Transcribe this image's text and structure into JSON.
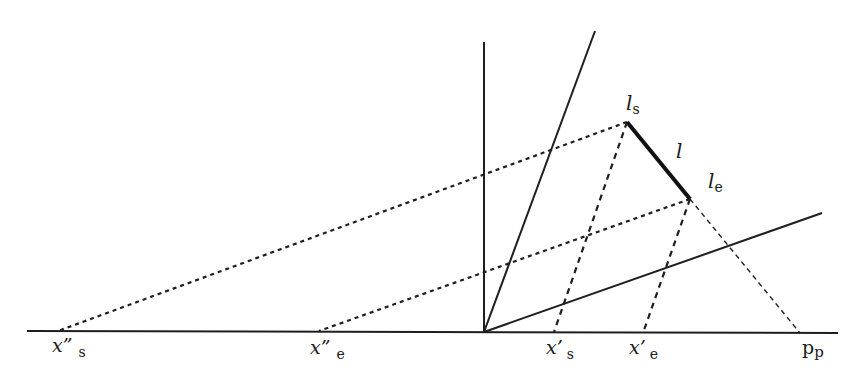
{
  "diagram": {
    "type": "geometric-projection",
    "colors": {
      "line": "#1e1e1e",
      "background": "#ffffff"
    },
    "points": {
      "origin": [
        484,
        332
      ],
      "l_s": [
        627,
        122
      ],
      "l_e": [
        690,
        199
      ],
      "x2_s": [
        58,
        331
      ],
      "x2_e": [
        319,
        331
      ],
      "x1_s": [
        554,
        332
      ],
      "x1_e": [
        643,
        333
      ],
      "p_p": [
        800,
        333
      ]
    },
    "labels": {
      "l_s": {
        "main": "l",
        "sub": "s"
      },
      "l_e": {
        "main": "l",
        "sub": "e"
      },
      "l": {
        "main": "l"
      },
      "x2_s": {
        "main": "x”",
        "sub": "s"
      },
      "x2_e": {
        "main": "x”",
        "sub": "e"
      },
      "x1_s": {
        "main": "x’",
        "sub": "s"
      },
      "x1_e": {
        "main": "x’",
        "sub": "e"
      },
      "p_p": {
        "main": "p",
        "sub": "p"
      }
    }
  }
}
